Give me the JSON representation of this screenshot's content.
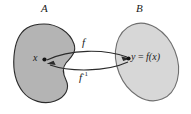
{
  "figure": {
    "kind": "math-diagram",
    "caption_absent": true,
    "background_color": "#ffffff",
    "sets": [
      {
        "id": "A",
        "label": "A",
        "shape": "bean-blob",
        "fill_color": "#b4b4b4",
        "stroke_color": "#2b2b2b",
        "side": "left"
      },
      {
        "id": "B",
        "label": "B",
        "shape": "tilted-ellipse",
        "fill_color": "#d7d7d7",
        "stroke_color": "#6f6f6f",
        "side": "right"
      }
    ],
    "points": [
      {
        "id": "x",
        "label": "x",
        "in_set": "A",
        "marker": "filled-dot",
        "marker_color": "#141414"
      },
      {
        "id": "y",
        "label": "y = f(x)",
        "label_var": "y",
        "label_equals": "=",
        "label_expr": "f(x)",
        "in_set": "B",
        "marker": "filled-dot",
        "marker_color": "#141414"
      }
    ],
    "arrows": [
      {
        "id": "forward",
        "label": "f",
        "from": "x",
        "to": "y",
        "direction": "left-to-right",
        "curve": "arc-upper",
        "stroke_color": "#2b2b2b"
      },
      {
        "id": "inverse",
        "label": "f",
        "label_superscript": "-1",
        "label_full": "f⁻¹",
        "from": "y",
        "to": "x",
        "direction": "right-to-left",
        "curve": "arc-lower",
        "stroke_color": "#2b2b2b"
      }
    ]
  }
}
